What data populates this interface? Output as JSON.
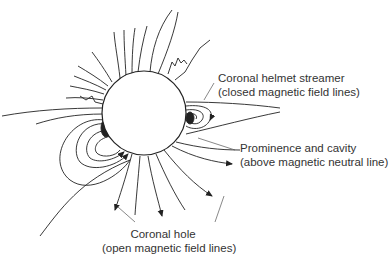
{
  "diagram": {
    "labels": {
      "helmet_title": "Coronal helmet streamer",
      "helmet_sub": "(closed magnetic field lines)",
      "prom_title": "Prominence and cavity",
      "prom_sub": "(above magnetic neutral line)",
      "hole_title": "Coronal hole",
      "hole_sub": "(open magnetic field lines)"
    },
    "colors": {
      "line": "#222222",
      "text": "#333333",
      "background": "#ffffff"
    }
  }
}
